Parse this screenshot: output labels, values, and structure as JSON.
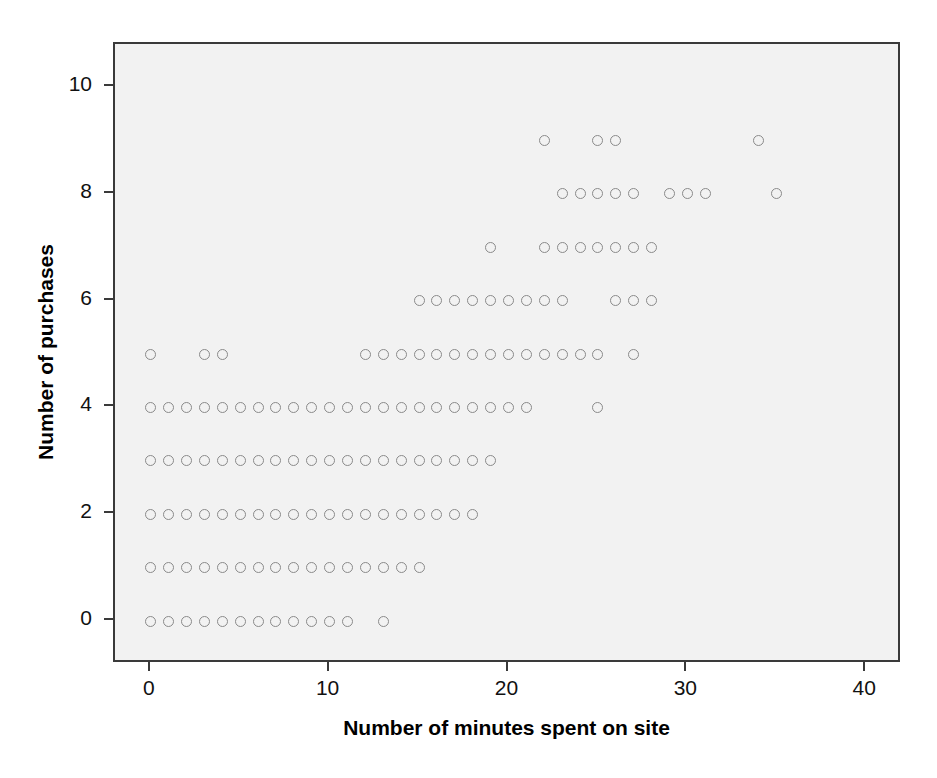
{
  "chart_data": {
    "type": "scatter",
    "title": "",
    "xlabel": "Number of minutes spent on site",
    "ylabel": "Number of purchases",
    "xlim": [
      -2,
      42
    ],
    "ylim": [
      -0.8,
      10.8
    ],
    "xticks": [
      0,
      10,
      20,
      30,
      40
    ],
    "yticks": [
      0,
      2,
      4,
      6,
      8,
      10
    ],
    "grid": false,
    "legend": null,
    "marker": {
      "shape": "circle-open",
      "edge_color": "#8a8a8a",
      "fill": "none",
      "size_px": 11
    },
    "plot_background": "#f2f2f2",
    "figure_background": "#ffffff",
    "frame_color": "#3a3a3a",
    "points": [
      {
        "x": 0,
        "y": 0
      },
      {
        "x": 1,
        "y": 0
      },
      {
        "x": 2,
        "y": 0
      },
      {
        "x": 3,
        "y": 0
      },
      {
        "x": 4,
        "y": 0
      },
      {
        "x": 5,
        "y": 0
      },
      {
        "x": 6,
        "y": 0
      },
      {
        "x": 7,
        "y": 0
      },
      {
        "x": 8,
        "y": 0
      },
      {
        "x": 9,
        "y": 0
      },
      {
        "x": 10,
        "y": 0
      },
      {
        "x": 11,
        "y": 0
      },
      {
        "x": 13,
        "y": 0
      },
      {
        "x": 0,
        "y": 1
      },
      {
        "x": 1,
        "y": 1
      },
      {
        "x": 2,
        "y": 1
      },
      {
        "x": 3,
        "y": 1
      },
      {
        "x": 4,
        "y": 1
      },
      {
        "x": 5,
        "y": 1
      },
      {
        "x": 6,
        "y": 1
      },
      {
        "x": 7,
        "y": 1
      },
      {
        "x": 8,
        "y": 1
      },
      {
        "x": 9,
        "y": 1
      },
      {
        "x": 10,
        "y": 1
      },
      {
        "x": 11,
        "y": 1
      },
      {
        "x": 12,
        "y": 1
      },
      {
        "x": 13,
        "y": 1
      },
      {
        "x": 14,
        "y": 1
      },
      {
        "x": 15,
        "y": 1
      },
      {
        "x": 0,
        "y": 2
      },
      {
        "x": 1,
        "y": 2
      },
      {
        "x": 2,
        "y": 2
      },
      {
        "x": 3,
        "y": 2
      },
      {
        "x": 4,
        "y": 2
      },
      {
        "x": 5,
        "y": 2
      },
      {
        "x": 6,
        "y": 2
      },
      {
        "x": 7,
        "y": 2
      },
      {
        "x": 8,
        "y": 2
      },
      {
        "x": 9,
        "y": 2
      },
      {
        "x": 10,
        "y": 2
      },
      {
        "x": 11,
        "y": 2
      },
      {
        "x": 12,
        "y": 2
      },
      {
        "x": 13,
        "y": 2
      },
      {
        "x": 14,
        "y": 2
      },
      {
        "x": 15,
        "y": 2
      },
      {
        "x": 16,
        "y": 2
      },
      {
        "x": 17,
        "y": 2
      },
      {
        "x": 18,
        "y": 2
      },
      {
        "x": 0,
        "y": 3
      },
      {
        "x": 1,
        "y": 3
      },
      {
        "x": 2,
        "y": 3
      },
      {
        "x": 3,
        "y": 3
      },
      {
        "x": 4,
        "y": 3
      },
      {
        "x": 5,
        "y": 3
      },
      {
        "x": 6,
        "y": 3
      },
      {
        "x": 7,
        "y": 3
      },
      {
        "x": 8,
        "y": 3
      },
      {
        "x": 9,
        "y": 3
      },
      {
        "x": 10,
        "y": 3
      },
      {
        "x": 11,
        "y": 3
      },
      {
        "x": 12,
        "y": 3
      },
      {
        "x": 13,
        "y": 3
      },
      {
        "x": 14,
        "y": 3
      },
      {
        "x": 15,
        "y": 3
      },
      {
        "x": 16,
        "y": 3
      },
      {
        "x": 17,
        "y": 3
      },
      {
        "x": 18,
        "y": 3
      },
      {
        "x": 19,
        "y": 3
      },
      {
        "x": 0,
        "y": 4
      },
      {
        "x": 1,
        "y": 4
      },
      {
        "x": 2,
        "y": 4
      },
      {
        "x": 3,
        "y": 4
      },
      {
        "x": 4,
        "y": 4
      },
      {
        "x": 5,
        "y": 4
      },
      {
        "x": 6,
        "y": 4
      },
      {
        "x": 7,
        "y": 4
      },
      {
        "x": 8,
        "y": 4
      },
      {
        "x": 9,
        "y": 4
      },
      {
        "x": 10,
        "y": 4
      },
      {
        "x": 11,
        "y": 4
      },
      {
        "x": 12,
        "y": 4
      },
      {
        "x": 13,
        "y": 4
      },
      {
        "x": 14,
        "y": 4
      },
      {
        "x": 15,
        "y": 4
      },
      {
        "x": 16,
        "y": 4
      },
      {
        "x": 17,
        "y": 4
      },
      {
        "x": 18,
        "y": 4
      },
      {
        "x": 19,
        "y": 4
      },
      {
        "x": 20,
        "y": 4
      },
      {
        "x": 21,
        "y": 4
      },
      {
        "x": 25,
        "y": 4
      },
      {
        "x": 0,
        "y": 5
      },
      {
        "x": 3,
        "y": 5
      },
      {
        "x": 4,
        "y": 5
      },
      {
        "x": 12,
        "y": 5
      },
      {
        "x": 13,
        "y": 5
      },
      {
        "x": 14,
        "y": 5
      },
      {
        "x": 15,
        "y": 5
      },
      {
        "x": 16,
        "y": 5
      },
      {
        "x": 17,
        "y": 5
      },
      {
        "x": 18,
        "y": 5
      },
      {
        "x": 19,
        "y": 5
      },
      {
        "x": 20,
        "y": 5
      },
      {
        "x": 21,
        "y": 5
      },
      {
        "x": 22,
        "y": 5
      },
      {
        "x": 23,
        "y": 5
      },
      {
        "x": 24,
        "y": 5
      },
      {
        "x": 25,
        "y": 5
      },
      {
        "x": 27,
        "y": 5
      },
      {
        "x": 15,
        "y": 6
      },
      {
        "x": 16,
        "y": 6
      },
      {
        "x": 17,
        "y": 6
      },
      {
        "x": 18,
        "y": 6
      },
      {
        "x": 19,
        "y": 6
      },
      {
        "x": 20,
        "y": 6
      },
      {
        "x": 21,
        "y": 6
      },
      {
        "x": 22,
        "y": 6
      },
      {
        "x": 23,
        "y": 6
      },
      {
        "x": 26,
        "y": 6
      },
      {
        "x": 27,
        "y": 6
      },
      {
        "x": 28,
        "y": 6
      },
      {
        "x": 19,
        "y": 7
      },
      {
        "x": 22,
        "y": 7
      },
      {
        "x": 23,
        "y": 7
      },
      {
        "x": 24,
        "y": 7
      },
      {
        "x": 25,
        "y": 7
      },
      {
        "x": 26,
        "y": 7
      },
      {
        "x": 27,
        "y": 7
      },
      {
        "x": 28,
        "y": 7
      },
      {
        "x": 23,
        "y": 8
      },
      {
        "x": 24,
        "y": 8
      },
      {
        "x": 25,
        "y": 8
      },
      {
        "x": 26,
        "y": 8
      },
      {
        "x": 27,
        "y": 8
      },
      {
        "x": 29,
        "y": 8
      },
      {
        "x": 30,
        "y": 8
      },
      {
        "x": 31,
        "y": 8
      },
      {
        "x": 35,
        "y": 8
      },
      {
        "x": 22,
        "y": 9
      },
      {
        "x": 25,
        "y": 9
      },
      {
        "x": 26,
        "y": 9
      },
      {
        "x": 34,
        "y": 9
      }
    ]
  }
}
